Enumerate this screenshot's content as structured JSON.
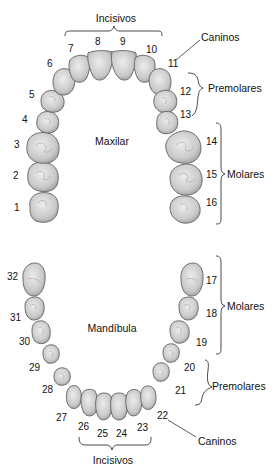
{
  "diagram": {
    "maxilla": {
      "label": "Maxilar",
      "groups": {
        "incisors": "Incisivos",
        "canines": "Caninos",
        "premolars": "Premolares",
        "molars": "Molares"
      },
      "teeth": [
        {
          "n": "1",
          "type": "molar"
        },
        {
          "n": "2",
          "type": "molar"
        },
        {
          "n": "3",
          "type": "molar"
        },
        {
          "n": "4",
          "type": "premolar"
        },
        {
          "n": "5",
          "type": "premolar"
        },
        {
          "n": "6",
          "type": "canine"
        },
        {
          "n": "7",
          "type": "incisor"
        },
        {
          "n": "8",
          "type": "incisor"
        },
        {
          "n": "9",
          "type": "incisor"
        },
        {
          "n": "10",
          "type": "incisor"
        },
        {
          "n": "11",
          "type": "canine"
        },
        {
          "n": "12",
          "type": "premolar"
        },
        {
          "n": "13",
          "type": "premolar"
        },
        {
          "n": "14",
          "type": "molar"
        },
        {
          "n": "15",
          "type": "molar"
        },
        {
          "n": "16",
          "type": "molar"
        }
      ]
    },
    "mandible": {
      "label": "Mandíbula",
      "groups": {
        "incisors": "Incisivos",
        "canines": "Caninos",
        "premolars": "Premolares",
        "molars": "Molares"
      },
      "teeth": [
        {
          "n": "17",
          "type": "molar"
        },
        {
          "n": "18",
          "type": "molar"
        },
        {
          "n": "19",
          "type": "molar"
        },
        {
          "n": "20",
          "type": "premolar"
        },
        {
          "n": "21",
          "type": "premolar"
        },
        {
          "n": "22",
          "type": "canine"
        },
        {
          "n": "23",
          "type": "incisor"
        },
        {
          "n": "24",
          "type": "incisor"
        },
        {
          "n": "25",
          "type": "incisor"
        },
        {
          "n": "26",
          "type": "incisor"
        },
        {
          "n": "27",
          "type": "canine"
        },
        {
          "n": "28",
          "type": "premolar"
        },
        {
          "n": "29",
          "type": "premolar"
        },
        {
          "n": "30",
          "type": "molar"
        },
        {
          "n": "31",
          "type": "molar"
        },
        {
          "n": "32",
          "type": "molar"
        }
      ]
    },
    "colors": {
      "tooth_fill_light": "#e6e6e6",
      "tooth_fill_dark": "#b5b5b5",
      "tooth_outline": "#6e6e6e",
      "text": "#111111",
      "background": "#ffffff"
    }
  }
}
